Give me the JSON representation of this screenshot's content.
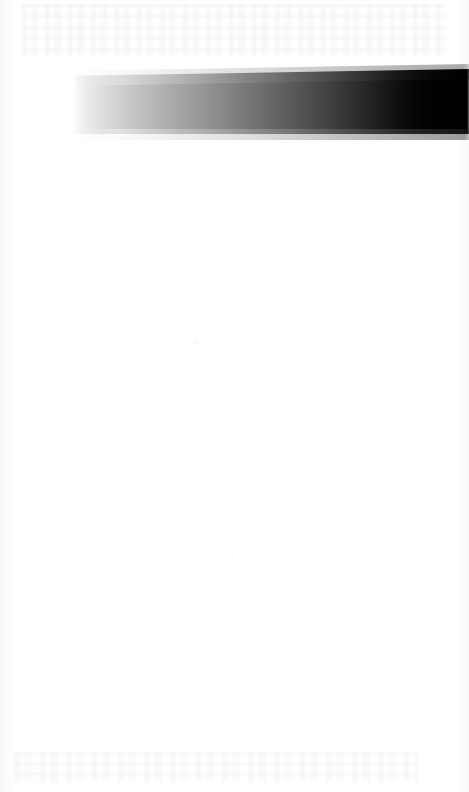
{
  "document": {
    "kind": "scanned-page",
    "page_width": 469,
    "page_height": 792,
    "background_color": "#fefefe",
    "content_text": "",
    "note": "Blank scanned page; only a horizontal gradient band is printed."
  },
  "band": {
    "name": "grayscale-gradient-band",
    "orientation": "horizontal",
    "left_color": "#ffffff",
    "mid_color": "#7c7c7c",
    "right_color": "#000000",
    "start_x": 72,
    "end_x": 469,
    "top_y": 69,
    "bottom_y": 134,
    "height": 65,
    "label": ""
  },
  "artifacts": {
    "top_ghost_label": "",
    "bottom_ghost_label": "",
    "speckle_label": "",
    "left_gutter_label": ""
  },
  "chart_data": {
    "type": "heatmap",
    "title": "",
    "subtitle": "",
    "xlabel": "",
    "ylabel": "",
    "categories": [
      "0%",
      "10%",
      "20%",
      "30%",
      "40%",
      "50%",
      "60%",
      "70%",
      "80%",
      "90%",
      "100%"
    ],
    "x": [
      72,
      112,
      152,
      191,
      231,
      271,
      310,
      350,
      390,
      429,
      469
    ],
    "series": [
      {
        "name": "Luminance",
        "values": [
          255,
          214,
          176,
          140,
          107,
          78,
          52,
          30,
          13,
          3,
          0
        ]
      }
    ],
    "colors": [
      "#ffffff",
      "#d6d6d6",
      "#b0b0b0",
      "#8c8c8c",
      "#6b6b6b",
      "#4e4e4e",
      "#343434",
      "#1e1e1e",
      "#0d0d0d",
      "#030303",
      "#000000"
    ],
    "ylim": [
      0,
      255
    ],
    "grid": false,
    "legend": false,
    "annotations": []
  }
}
